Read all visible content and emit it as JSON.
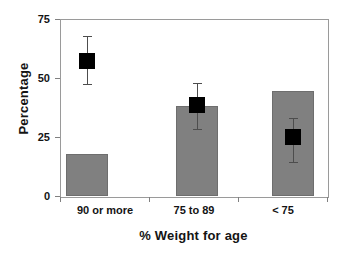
{
  "chart_data": {
    "type": "bar",
    "title": "",
    "xlabel": "% Weight for age",
    "ylabel": "Percentage",
    "categories": [
      "90 or more",
      "75 to 89",
      "< 75"
    ],
    "values": [
      18,
      38,
      44.5
    ],
    "series": [
      {
        "name": "Percentage",
        "type": "bar",
        "values": [
          18,
          38,
          44.5
        ]
      },
      {
        "name": "Point estimate with 95% CI",
        "type": "scatter-with-error",
        "values": [
          57,
          38.5,
          25
        ],
        "error_low": [
          47.5,
          28.5,
          14.5
        ],
        "error_high": [
          68,
          48,
          33
        ]
      }
    ],
    "ylim": [
      0,
      75
    ],
    "yticks": [
      0,
      25,
      50,
      75
    ],
    "ytick_labels": [
      "0",
      "25",
      "50",
      "75"
    ],
    "grid": false,
    "legend": "none",
    "colors": {
      "bar_fill": "#808080",
      "bar_edge": "#6e6e6e",
      "marker": "#000000",
      "error_line": "#4d4d4d",
      "frame": "#9a9a9a",
      "text": "#141414",
      "background": "#ffffff"
    }
  },
  "axes": {
    "y_title": "Percentage",
    "x_title": "% Weight for age",
    "y_ticks": [
      {
        "label": "75",
        "value": 75
      },
      {
        "label": "50",
        "value": 50
      },
      {
        "label": "25",
        "value": 25
      },
      {
        "label": "0",
        "value": 0
      }
    ],
    "x_ticks": [
      {
        "label": "90 or more"
      },
      {
        "label": "75 to 89"
      },
      {
        "label": "< 75"
      }
    ]
  }
}
